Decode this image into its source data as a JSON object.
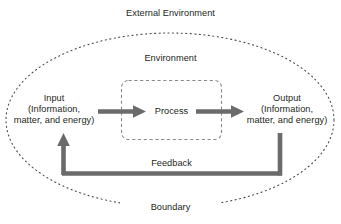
{
  "diagram": {
    "title": "External Environment",
    "type": "systems-model",
    "labels": {
      "external_environment": "External Environment",
      "environment": "Environment",
      "boundary": "Boundary",
      "process": "Process",
      "feedback": "Feedback",
      "input_line1": "Input",
      "input_line2": "(Information,",
      "input_line3": "matter, and energy)",
      "output_line1": "Output",
      "output_line2": "(Information,",
      "output_line3": "matter, and energy)"
    },
    "colors": {
      "text": "#231f20",
      "arrow": "#6b6b6b",
      "boundary_line": "#4d4d4d",
      "process_box_line": "#8a8a8a",
      "background": "#ffffff"
    },
    "shapes": {
      "boundary_ellipse": {
        "style": "dotted",
        "cx": 170,
        "cy": 120,
        "rx": 164,
        "ry": 87
      },
      "process_box": {
        "style": "dashed",
        "x": 121,
        "y": 80,
        "width": 101,
        "height": 60,
        "corner_radius": 7
      }
    },
    "flows": [
      {
        "name": "input-to-process",
        "from": "Input",
        "to": "Process",
        "direction": "right"
      },
      {
        "name": "process-to-output",
        "from": "Process",
        "to": "Output",
        "direction": "right"
      },
      {
        "name": "output-to-input-feedback",
        "from": "Output",
        "to": "Input",
        "direction": "left",
        "label": "Feedback"
      }
    ]
  }
}
